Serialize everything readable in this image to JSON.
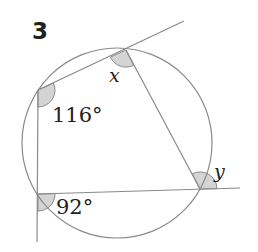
{
  "problem": {
    "number": "3",
    "labels": {
      "angle_x": "x",
      "angle_y": "y",
      "angle_116": "116°",
      "angle_92": "92°"
    }
  },
  "diagram": {
    "type": "cyclic-quadrilateral",
    "circle": {
      "cx": 117,
      "cy": 143,
      "r": 95
    },
    "vertices": {
      "A": [
        126,
        50
      ],
      "B": [
        38,
        90
      ],
      "C": [
        38,
        194
      ],
      "D": [
        200,
        189
      ]
    },
    "colors": {
      "line": "#8a8a8a",
      "angle_fill": "#d4d4d4",
      "text": "#231f20"
    }
  }
}
